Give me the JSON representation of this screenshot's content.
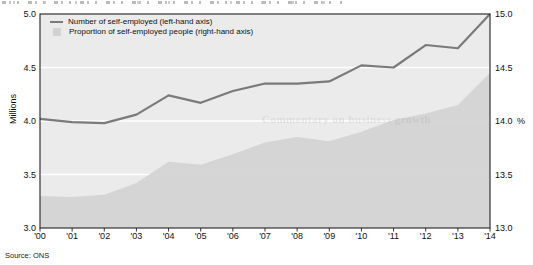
{
  "page": {
    "source_note": "Source: ONS",
    "watermark_text": "Commentary on business growth"
  },
  "colors": {
    "plot_background": "#ebebeb",
    "gridline": "#ffffff",
    "frame": "#333333",
    "line_series": "#7a7a7a",
    "area_series": "#d2d2d2"
  },
  "chart_data": {
    "type": "combo",
    "subtype": [
      "line",
      "area"
    ],
    "x": [
      "'00",
      "'01",
      "'02",
      "'03",
      "'04",
      "'05",
      "'06",
      "'07",
      "'08",
      "'09",
      "'10",
      "'11",
      "'12",
      "'13",
      "'14"
    ],
    "series": [
      {
        "name": "Number of self-employed (left-hand axis)",
        "type": "line",
        "axis": "left",
        "color": "#7a7a7a",
        "values": [
          4.02,
          3.99,
          3.98,
          4.06,
          4.24,
          4.17,
          4.28,
          4.35,
          4.35,
          4.37,
          4.52,
          4.5,
          4.71,
          4.68,
          5.0
        ]
      },
      {
        "name": "Proportion of self-employed people (right-hand axis)",
        "type": "area",
        "axis": "right",
        "color": "#d2d2d2",
        "values": [
          13.3,
          13.29,
          13.31,
          13.42,
          13.62,
          13.59,
          13.69,
          13.8,
          13.85,
          13.81,
          13.9,
          14.01,
          14.07,
          14.15,
          14.45
        ]
      }
    ],
    "left_axis": {
      "label": "Millions",
      "min": 3.0,
      "max": 5.0,
      "ticks": [
        "5.0",
        "4.5",
        "4.0",
        "3.5",
        "3.0"
      ]
    },
    "right_axis": {
      "label": "%",
      "min": 13.0,
      "max": 15.0,
      "ticks": [
        "15.0",
        "14.5",
        "14.0",
        "13.5",
        "13.0"
      ]
    },
    "grid": "horizontal white gridlines at 0.5 intervals",
    "legend_position": "top-left inside plot"
  }
}
